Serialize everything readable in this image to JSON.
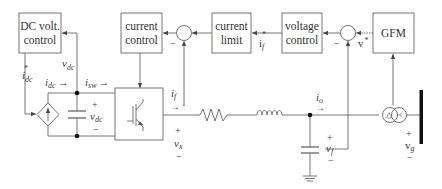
{
  "diagram": {
    "type": "block-diagram",
    "blocks": {
      "dc_volt_control": [
        "DC volt.",
        "control"
      ],
      "current_control": [
        "current",
        "control"
      ],
      "current_limit": [
        "current",
        "limit"
      ],
      "voltage_control": [
        "voltage",
        "control"
      ],
      "gfm": [
        "GFM"
      ]
    },
    "summing_junctions": [
      {
        "id": "sum-current",
        "minus_sign": "−"
      },
      {
        "id": "sum-voltage",
        "minus_sign": "−"
      }
    ],
    "signals": {
      "i_dc_ref": {
        "base": "i",
        "sub": "dc",
        "sup": "*"
      },
      "i_dc": {
        "base": "i",
        "sub": "dc",
        "arrow": "→"
      },
      "i_sw": {
        "base": "i",
        "sub": "sw",
        "arrow": "→"
      },
      "v_dc_feedback": {
        "base": "v",
        "sub": "dc"
      },
      "v_dc_cap": {
        "base": "v",
        "sub": "dc",
        "plus": "+",
        "minus": "−"
      },
      "i_f": {
        "base": "i",
        "sub": "f",
        "arrow": "→"
      },
      "i_f_ref": {
        "base": "i",
        "sub": "f",
        "sup": "*"
      },
      "v_ref": {
        "base": "v",
        "sup": "*"
      },
      "v_x": {
        "base": "v",
        "sub": "x",
        "plus": "+",
        "minus": "−"
      },
      "i_o": {
        "base": "i",
        "sub": "o",
        "arrow": "→"
      },
      "v_f": {
        "base": "v",
        "sub": "f",
        "plus": "+",
        "minus": "−"
      },
      "v_g": {
        "base": "v",
        "sub": "g",
        "plus": "+",
        "minus": "−"
      }
    },
    "components": [
      "dependent-current-source",
      "dc-capacitor",
      "igbt-converter",
      "resistor",
      "inductor",
      "filter-capacitor",
      "ground",
      "delta-wye-transformer",
      "grid-bus"
    ],
    "colors": {
      "line": "#555555",
      "text": "#333333",
      "bus": "#111111"
    }
  }
}
